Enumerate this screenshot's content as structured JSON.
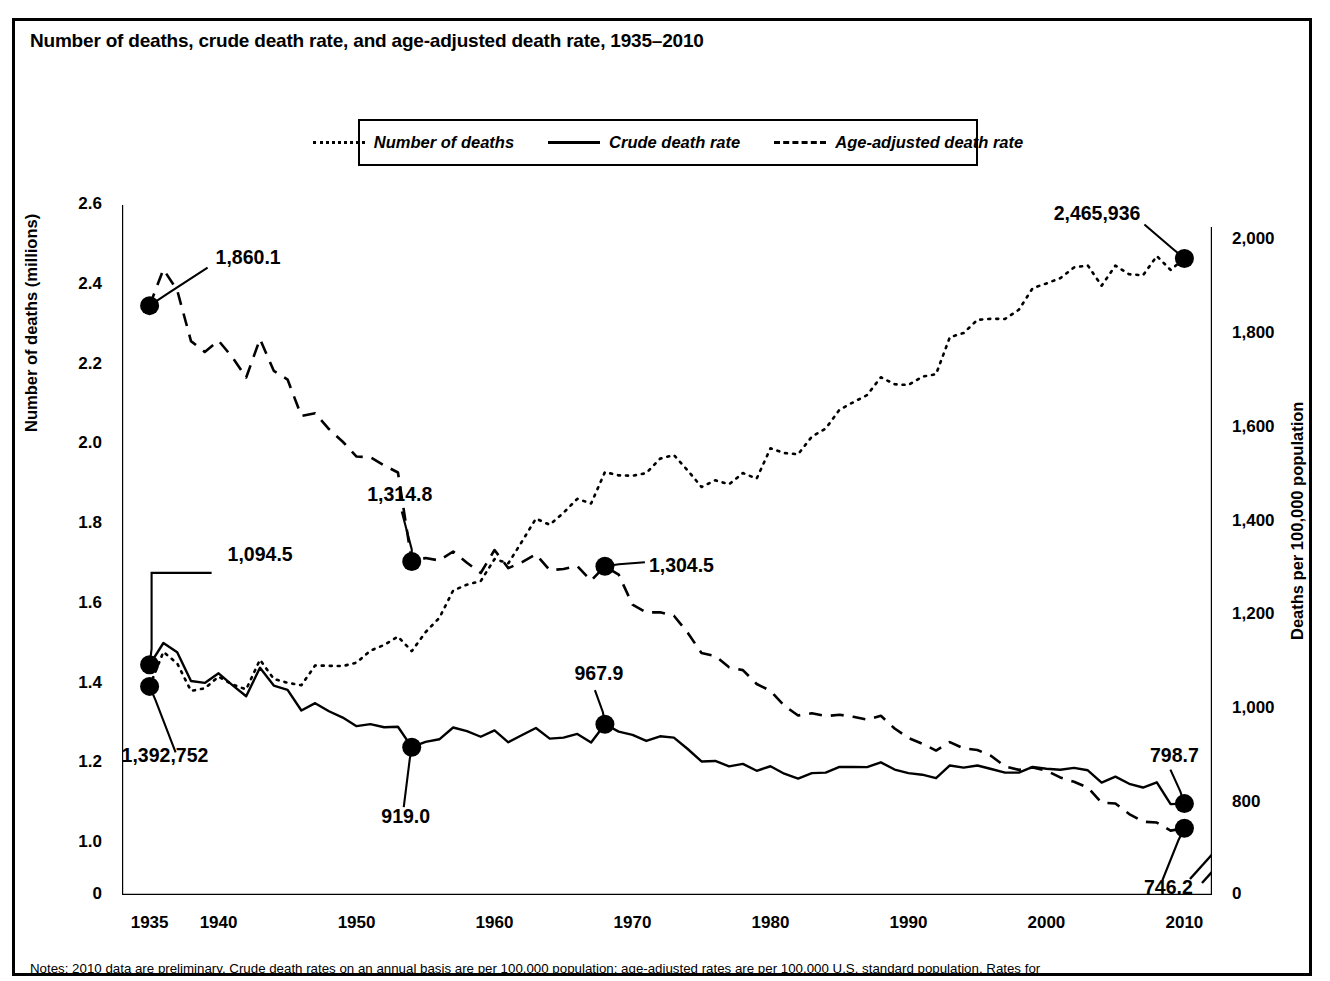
{
  "figure": {
    "title": "Number of deaths, crude death rate, and age-adjusted death rate, 1935–2010",
    "note": "Notes: 2010 data are preliminary. Crude death rates on an annual basis are per 100,000 population; age-adjusted rates are per 100,000 U.S. standard population. Rates for"
  },
  "legend": {
    "items": [
      {
        "label": "Number of deaths",
        "style": "dotted"
      },
      {
        "label": "Crude death rate",
        "style": "solid"
      },
      {
        "label": "Age-adjusted death rate",
        "style": "dashed"
      }
    ]
  },
  "axes": {
    "left_title": "Number of deaths (millions)",
    "right_title": "Deaths per 100,000 population",
    "left_ticks": [
      "2.6",
      "2.4",
      "2.2",
      "2.0",
      "1.8",
      "1.6",
      "1.4",
      "1.2",
      "1.0",
      "0"
    ],
    "right_ticks": [
      "2,000",
      "1,800",
      "1,600",
      "1,400",
      "1,200",
      "1,000",
      "800",
      "0"
    ],
    "x_ticks": [
      "1935",
      "1940",
      "1950",
      "1960",
      "1970",
      "1980",
      "1990",
      "2000",
      "2010"
    ]
  },
  "chart_data": {
    "type": "line",
    "title": "Number of deaths, crude death rate, and age-adjusted death rate, 1935–2010",
    "xlabel": "",
    "ylabel": "Number of deaths (millions)",
    "y2label": "Deaths per 100,000 population",
    "xlim": [
      1933,
      2012
    ],
    "ylim": [
      0.95,
      2.62
    ],
    "y2lim": [
      730,
      2030
    ],
    "grid": false,
    "legend_position": "top-center",
    "x": [
      1935,
      1936,
      1937,
      1938,
      1939,
      1940,
      1941,
      1942,
      1943,
      1944,
      1945,
      1946,
      1947,
      1948,
      1949,
      1950,
      1951,
      1952,
      1953,
      1954,
      1955,
      1956,
      1957,
      1958,
      1959,
      1960,
      1961,
      1962,
      1963,
      1964,
      1965,
      1966,
      1967,
      1968,
      1969,
      1970,
      1971,
      1972,
      1973,
      1974,
      1975,
      1976,
      1977,
      1978,
      1979,
      1980,
      1981,
      1982,
      1983,
      1984,
      1985,
      1986,
      1987,
      1988,
      1989,
      1990,
      1991,
      1992,
      1993,
      1994,
      1995,
      1996,
      1997,
      1998,
      1999,
      2000,
      2001,
      2002,
      2003,
      2004,
      2005,
      2006,
      2007,
      2008,
      2009,
      2010
    ],
    "series": [
      {
        "name": "Number of deaths",
        "style": "dotted",
        "axis": "left",
        "units": "millions",
        "values": [
          1.392752,
          1.479228,
          1.450427,
          1.381391,
          1.387897,
          1.417269,
          1.397642,
          1.385187,
          1.459544,
          1.411338,
          1.401719,
          1.395617,
          1.44537,
          1.444337,
          1.443607,
          1.452454,
          1.482099,
          1.496838,
          1.517541,
          1.481091,
          1.528717,
          1.564476,
          1.633128,
          1.647886,
          1.656814,
          1.711982,
          1.701522,
          1.75672,
          1.813549,
          1.798051,
          1.828136,
          1.863149,
          1.851323,
          1.930082,
          1.92199,
          1.921031,
          1.927542,
          1.963944,
          1.973003,
          1.934388,
          1.892879,
          1.90944,
          1.899597,
          1.927788,
          1.913841,
          1.989841,
          1.977981,
          1.974797,
          2.019201,
          2.039369,
          2.08644,
          2.105361,
          2.123323,
          2.167999,
          2.150466,
          2.148463,
          2.169518,
          2.175613,
          2.268553,
          2.278994,
          2.312132,
          2.31469,
          2.314245,
          2.337256,
          2.391399,
          2.403351,
          2.416425,
          2.443387,
          2.448288,
          2.397615,
          2.448017,
          2.426264,
          2.423712,
          2.471984,
          2.437163,
          2.465936
        ]
      },
      {
        "name": "Crude death rate",
        "style": "solid",
        "axis": "right",
        "units": "per 100,000 population",
        "values": [
          1094.5,
          1141.0,
          1121.1,
          1060.0,
          1056.0,
          1076.4,
          1051.2,
          1027.6,
          1088.1,
          1050.3,
          1041.2,
          997.1,
          1012.8,
          995.5,
          982.1,
          963.8,
          968.1,
          961.4,
          962.6,
          919.0,
          930.4,
          935.8,
          960.9,
          953.1,
          941.2,
          954.7,
          929.4,
          945.0,
          959.8,
          937.2,
          939.4,
          947.2,
          928.8,
          967.9,
          952.2,
          945.3,
          932.3,
          942.2,
          939.4,
          915.1,
          888.5,
          889.6,
          878.1,
          883.4,
          868.7,
          878.3,
          862.4,
          852.2,
          863.7,
          864.8,
          876.9,
          876.7,
          876.4,
          886.7,
          871.3,
          863.8,
          860.3,
          852.9,
          880.0,
          875.4,
          880.0,
          872.5,
          864.7,
          864.7,
          877.0,
          873.1,
          870.9,
          874.8,
          869.7,
          843.5,
          856.2,
          840.9,
          833.0,
          844.1,
          797.5,
          798.7
        ]
      },
      {
        "name": "Age-adjusted death rate",
        "style": "dashed",
        "axis": "right",
        "units": "per 100,000 U.S. standard population",
        "values": [
          1860.1,
          1937.5,
          1893.0,
          1784.5,
          1761.4,
          1785.4,
          1750.0,
          1706.9,
          1789.0,
          1721.2,
          1702.5,
          1625.1,
          1630.7,
          1597.0,
          1570.0,
          1538.5,
          1537.0,
          1519.7,
          1504.4,
          1314.8,
          1322.1,
          1316.9,
          1336.0,
          1312.0,
          1290.3,
          1339.2,
          1300.5,
          1313.5,
          1330.0,
          1296.1,
          1298.7,
          1304.9,
          1274.0,
          1304.5,
          1286.7,
          1222.6,
          1206.3,
          1206.4,
          1199.2,
          1163.1,
          1119.5,
          1113.1,
          1089.5,
          1083.2,
          1053.7,
          1039.1,
          1007.7,
          986.5,
          991.3,
          985.2,
          988.2,
          983.7,
          977.6,
          986.0,
          958.7,
          938.7,
          926.5,
          911.8,
          929.8,
          916.3,
          913.1,
          900.3,
          878.1,
          870.6,
          875.6,
          869.0,
          854.5,
          845.3,
          832.7,
          800.8,
          798.8,
          776.5,
          760.2,
          758.3,
          741.1,
          746.2
        ]
      }
    ],
    "annotations": [
      {
        "label": "1,860.1",
        "series": "Age-adjusted death rate",
        "x": 1935,
        "y": 1860.1
      },
      {
        "label": "1,094.5",
        "series": "Crude death rate",
        "x": 1935,
        "y": 1094.5
      },
      {
        "label": "1,392,752",
        "series": "Number of deaths",
        "x": 1935,
        "y": 1392752
      },
      {
        "label": "1,314.8",
        "series": "Age-adjusted death rate",
        "x": 1954,
        "y": 1314.8
      },
      {
        "label": "919.0",
        "series": "Crude death rate",
        "x": 1954,
        "y": 919.0
      },
      {
        "label": "1,304.5",
        "series": "Age-adjusted death rate",
        "x": 1968,
        "y": 1304.5
      },
      {
        "label": "967.9",
        "series": "Crude death rate",
        "x": 1968,
        "y": 967.9
      },
      {
        "label": "2,465,936",
        "series": "Number of deaths",
        "x": 2010,
        "y": 2465936
      },
      {
        "label": "798.7",
        "series": "Crude death rate",
        "x": 2010,
        "y": 798.7
      },
      {
        "label": "746.2",
        "series": "Age-adjusted death rate",
        "x": 2010,
        "y": 746.2
      }
    ]
  }
}
